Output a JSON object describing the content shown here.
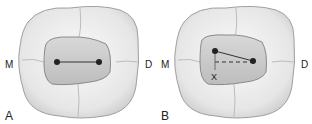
{
  "panels": [
    {
      "id": "A",
      "letter": "A",
      "mesial": "M",
      "distal": "D",
      "line_style": "solid"
    },
    {
      "id": "B",
      "letter": "B",
      "mesial": "M",
      "distal": "D",
      "axis_label": "X",
      "line_style": "angled-with-dashed-reference"
    }
  ],
  "colors": {
    "tooth": "#f2f2f2",
    "outline": "#9a9a9a",
    "restoration": "#c9c9c9",
    "point": "#222222"
  }
}
